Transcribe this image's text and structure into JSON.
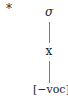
{
  "diagram": {
    "marker": "*",
    "tiers": [
      {
        "label": "σ",
        "role": "syllable-node"
      },
      {
        "label": "x",
        "role": "timing-slot"
      },
      {
        "label": "[−voc]",
        "role": "feature-bundle"
      }
    ],
    "associations": [
      [
        "σ",
        "x"
      ],
      [
        "x",
        "[−voc]"
      ]
    ]
  }
}
